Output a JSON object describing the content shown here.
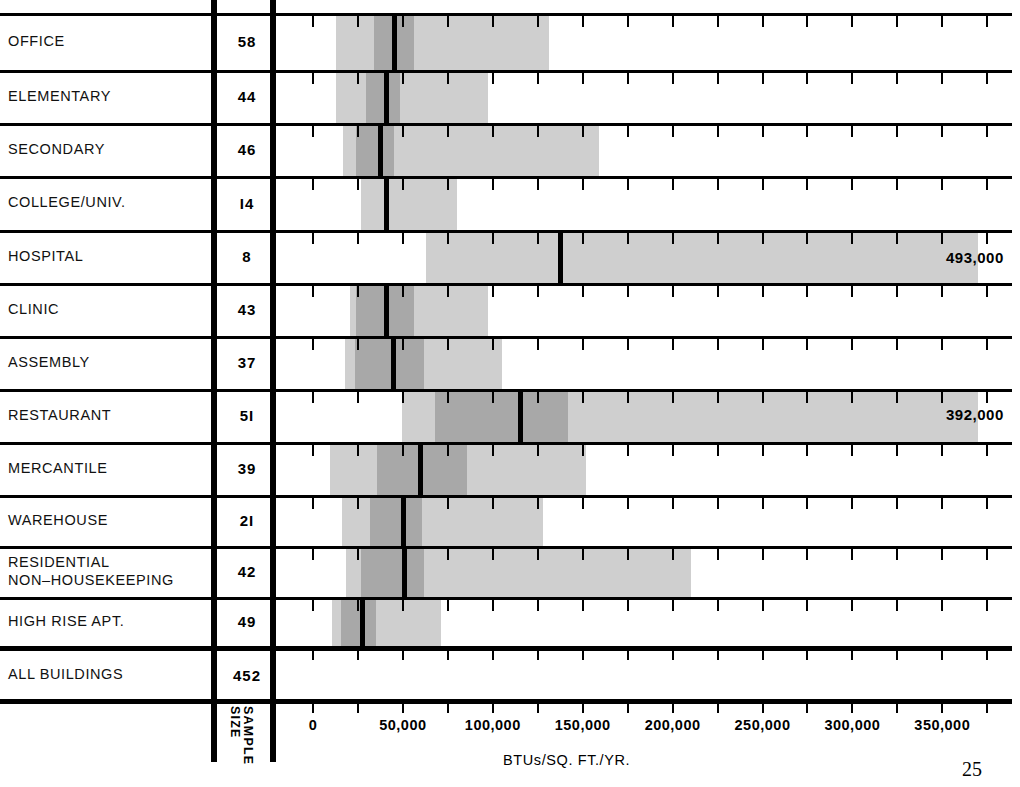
{
  "chart_data": {
    "type": "bar",
    "title": "",
    "subtitle": "",
    "xlabel": "BTUs/SQ. FT./YR.",
    "ylabel": "",
    "sample_size_header": "SAMPLE SIZE",
    "xlim": [
      0,
      375000
    ],
    "xticks_major": [
      0,
      50000,
      100000,
      150000,
      200000,
      250000,
      300000,
      350000
    ],
    "xticklabels": [
      "0",
      "50,000",
      "100,000",
      "150,000",
      "200,000",
      "250,000",
      "300,000",
      "350,000"
    ],
    "xtick_minor_step": 25000,
    "grid": false,
    "legend": "none",
    "colors": {
      "outer_band": "#cfcfcf",
      "inner_band": "#a8a8a8",
      "median": "#000000",
      "rule": "#000000",
      "background": "#ffffff"
    },
    "categories": [
      "OFFICE",
      "ELEMENTARY",
      "SECONDARY",
      "COLLEGE/UNIV.",
      "HOSPITAL",
      "CLINIC",
      "ASSEMBLY",
      "RESTAURANT",
      "MERCANTILE",
      "WAREHOUSE",
      "RESIDENTIAL NON–HOUSEKEEPING",
      "HIGH RISE APT.",
      "ALL BUILDINGS"
    ],
    "series": [
      {
        "name": "outer range (low)",
        "values": [
          13000,
          13000,
          16500,
          26500,
          63000,
          20500,
          18000,
          49500,
          9500,
          16000,
          18500,
          10500,
          null
        ]
      },
      {
        "name": "outer range (high)",
        "values": [
          131000,
          97500,
          159000,
          80000,
          370000,
          97500,
          105000,
          370000,
          152000,
          128000,
          210000,
          71000,
          null
        ]
      },
      {
        "name": "inner range (low)",
        "values": [
          34000,
          29500,
          24000,
          null,
          null,
          24000,
          23500,
          68000,
          35500,
          31500,
          26500,
          15500,
          null
        ]
      },
      {
        "name": "inner range (high)",
        "values": [
          56000,
          48500,
          45000,
          null,
          null,
          56000,
          61500,
          142000,
          85500,
          60500,
          61500,
          35000,
          null
        ]
      },
      {
        "name": "median",
        "values": [
          45000,
          40500,
          37500,
          40500,
          137500,
          40500,
          44500,
          115000,
          59500,
          50000,
          50500,
          27000,
          null
        ]
      }
    ],
    "rows": [
      {
        "label": "OFFICE",
        "sample_size": "58",
        "outer": [
          13000,
          131000
        ],
        "inner": [
          34000,
          56000
        ],
        "median": 45000,
        "annotation": ""
      },
      {
        "label": "ELEMENTARY",
        "sample_size": "44",
        "outer": [
          13000,
          97500
        ],
        "inner": [
          29500,
          48500
        ],
        "median": 40500,
        "annotation": ""
      },
      {
        "label": "SECONDARY",
        "sample_size": "46",
        "outer": [
          16500,
          159000
        ],
        "inner": [
          24000,
          45000
        ],
        "median": 37500,
        "annotation": ""
      },
      {
        "label": "COLLEGE/UNIV.",
        "sample_size": "I4",
        "outer": [
          26500,
          80000
        ],
        "inner": null,
        "median": 40500,
        "annotation": ""
      },
      {
        "label": "HOSPITAL",
        "sample_size": "8",
        "outer": [
          63000,
          370000
        ],
        "inner": null,
        "median": 137500,
        "annotation": "493,000"
      },
      {
        "label": "CLINIC",
        "sample_size": "43",
        "outer": [
          20500,
          97500
        ],
        "inner": [
          24000,
          56000
        ],
        "median": 40500,
        "annotation": ""
      },
      {
        "label": "ASSEMBLY",
        "sample_size": "37",
        "outer": [
          18000,
          105000
        ],
        "inner": [
          23500,
          61500
        ],
        "median": 44500,
        "annotation": ""
      },
      {
        "label": "RESTAURANT",
        "sample_size": "5I",
        "outer": [
          49500,
          370000
        ],
        "inner": [
          68000,
          142000
        ],
        "median": 115000,
        "annotation": "392,000"
      },
      {
        "label": "MERCANTILE",
        "sample_size": "39",
        "outer": [
          9500,
          152000
        ],
        "inner": [
          35500,
          85500
        ],
        "median": 59500,
        "annotation": ""
      },
      {
        "label": "WAREHOUSE",
        "sample_size": "2I",
        "outer": [
          16000,
          128000
        ],
        "inner": [
          31500,
          60500
        ],
        "median": 50000,
        "annotation": ""
      },
      {
        "label": "RESIDENTIAL\nNON–HOUSEKEEPING",
        "sample_size": "42",
        "outer": [
          18500,
          210000
        ],
        "inner": [
          26500,
          61500
        ],
        "median": 50500,
        "annotation": ""
      },
      {
        "label": "HIGH RISE APT.",
        "sample_size": "49",
        "outer": [
          10500,
          71000
        ],
        "inner": [
          15500,
          35000
        ],
        "median": 27000,
        "annotation": ""
      },
      {
        "label": "ALL BUILDINGS",
        "sample_size": "452",
        "outer": null,
        "inner": null,
        "median": null,
        "annotation": ""
      }
    ]
  },
  "page": {
    "number": "25"
  }
}
